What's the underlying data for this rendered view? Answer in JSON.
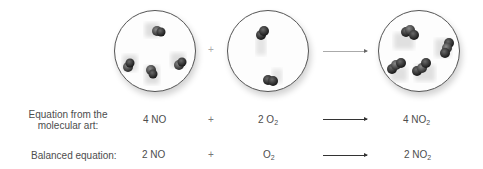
{
  "figure": {
    "molecular_art": {
      "reactant1": {
        "species": "NO",
        "count": 4
      },
      "plus_symbol": "+",
      "reactant2": {
        "species": "O2",
        "count": 2
      },
      "arrow": "→",
      "product": {
        "species": "NO2",
        "count": 4
      }
    },
    "rows": [
      {
        "label_line1": "Equation from the",
        "label_line2": "molecular art:",
        "reactant1": "4 NO",
        "plus": "+",
        "reactant2_coef": "2 O",
        "reactant2_sub": "2",
        "product_coef": "4 NO",
        "product_sub": "2"
      },
      {
        "label": "Balanced equation:",
        "reactant1": "2 NO",
        "plus": "+",
        "reactant2_coef": "O",
        "reactant2_sub": "2",
        "product_coef": "2 NO",
        "product_sub": "2"
      }
    ]
  },
  "colors": {
    "atom_dark": "#2e2e2e",
    "atom_mid": "#5a5a5a",
    "text": "#4d4d4d",
    "circle_border": "#555555"
  }
}
